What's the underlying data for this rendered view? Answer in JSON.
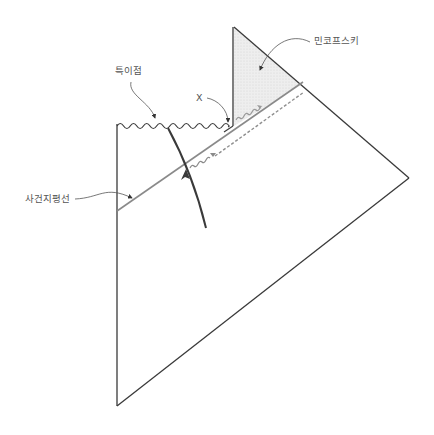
{
  "diagram": {
    "type": "penrose-diagram",
    "labels": {
      "singularity": "특이점",
      "x_point": "X",
      "minkowski": "민코프스키",
      "event_horizon": "사건지평선"
    },
    "colors": {
      "outline": "#3a3a3a",
      "horizon": "#8a8a8a",
      "dashed": "#8f8f8f",
      "shade": "#ececec",
      "worldline": "#3a3a3a",
      "label_text": "#555555",
      "leader": "#555555"
    }
  }
}
